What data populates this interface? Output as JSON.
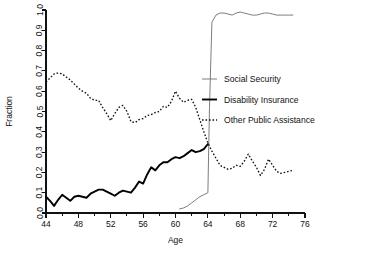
{
  "chart_data": {
    "type": "line",
    "title": "",
    "xlabel": "Age",
    "ylabel": "Fraction",
    "xlim": [
      44,
      76
    ],
    "ylim": [
      0.0,
      1.0
    ],
    "grid": false,
    "legend_position": "center-right",
    "x_ticks_major": [
      44,
      48,
      52,
      56,
      60,
      64,
      68,
      72,
      76
    ],
    "x_ticks_minor": [
      46,
      50,
      54,
      58,
      62,
      66,
      70,
      74
    ],
    "x_tick_labels": [
      "44",
      "48",
      "52",
      "56",
      "60",
      "64",
      "68",
      "72",
      "76"
    ],
    "y_ticks": [
      0.0,
      0.1,
      0.2,
      0.3,
      0.4,
      0.5,
      0.6,
      0.7,
      0.8,
      0.9,
      1.0
    ],
    "y_tick_labels": [
      "0.0",
      "0.1",
      "0.2",
      "0.3",
      "0.4",
      "0.5",
      "0.6",
      "0.7",
      "0.8",
      "0.9",
      "1.0"
    ],
    "series": [
      {
        "name": "Social Security",
        "style": "thin-solid",
        "color": "#7d7d7d",
        "x": [
          60.5,
          61,
          61.5,
          62,
          62.5,
          63,
          63.5,
          64,
          64.2,
          64.5,
          65,
          65.5,
          66,
          66.5,
          67,
          67.5,
          68,
          68.5,
          69,
          69.5,
          70,
          70.5,
          71,
          71.5,
          72,
          72.5,
          73,
          73.5,
          74,
          74.5
        ],
        "values": [
          0.02,
          0.025,
          0.035,
          0.05,
          0.065,
          0.08,
          0.09,
          0.1,
          0.52,
          0.94,
          0.975,
          0.985,
          0.985,
          0.98,
          0.975,
          0.985,
          0.99,
          0.985,
          0.98,
          0.975,
          0.975,
          0.98,
          0.985,
          0.985,
          0.98,
          0.975,
          0.975,
          0.975,
          0.975,
          0.975
        ]
      },
      {
        "name": "Disability Insurance",
        "style": "thick-solid",
        "color": "#000000",
        "x": [
          44,
          44.5,
          45,
          45.5,
          46,
          46.5,
          47,
          47.5,
          48,
          48.5,
          49,
          49.5,
          50,
          50.5,
          51,
          51.5,
          52,
          52.5,
          53,
          53.5,
          54,
          54.5,
          55,
          55.5,
          56,
          56.5,
          57,
          57.5,
          58,
          58.5,
          59,
          59.5,
          60,
          60.5,
          61,
          61.5,
          62,
          62.5,
          63,
          63.5,
          64
        ],
        "values": [
          0.08,
          0.06,
          0.035,
          0.065,
          0.09,
          0.075,
          0.06,
          0.08,
          0.085,
          0.08,
          0.075,
          0.095,
          0.105,
          0.115,
          0.115,
          0.105,
          0.095,
          0.085,
          0.1,
          0.11,
          0.105,
          0.1,
          0.125,
          0.155,
          0.145,
          0.19,
          0.225,
          0.21,
          0.235,
          0.25,
          0.25,
          0.265,
          0.275,
          0.27,
          0.28,
          0.295,
          0.31,
          0.3,
          0.305,
          0.315,
          0.34
        ]
      },
      {
        "name": "Other Public Assistance",
        "style": "dotted",
        "color": "#111111",
        "x": [
          44,
          44.5,
          45,
          45.5,
          46,
          46.5,
          47,
          47.5,
          48,
          48.5,
          49,
          49.5,
          50,
          50.5,
          51,
          51.5,
          52,
          52.5,
          53,
          53.5,
          54,
          54.5,
          55,
          55.5,
          56,
          56.5,
          57,
          57.5,
          58,
          58.5,
          59,
          59.5,
          60,
          60.5,
          61,
          61.5,
          62,
          62.5,
          63,
          63.5,
          64,
          64.5,
          65,
          65.5,
          66,
          66.5,
          67,
          67.5,
          68,
          68.5,
          69,
          69.5,
          70,
          70.5,
          71,
          71.5,
          72,
          72.5,
          73,
          73.5,
          74,
          74.5
        ],
        "values": [
          0.645,
          0.665,
          0.685,
          0.69,
          0.685,
          0.67,
          0.655,
          0.635,
          0.615,
          0.6,
          0.59,
          0.565,
          0.555,
          0.555,
          0.52,
          0.49,
          0.455,
          0.49,
          0.52,
          0.53,
          0.5,
          0.45,
          0.445,
          0.46,
          0.465,
          0.48,
          0.485,
          0.495,
          0.5,
          0.525,
          0.52,
          0.55,
          0.6,
          0.565,
          0.545,
          0.555,
          0.56,
          0.52,
          0.46,
          0.4,
          0.345,
          0.305,
          0.27,
          0.235,
          0.225,
          0.215,
          0.22,
          0.235,
          0.23,
          0.255,
          0.29,
          0.255,
          0.225,
          0.185,
          0.215,
          0.265,
          0.235,
          0.205,
          0.195,
          0.2,
          0.205,
          0.21
        ]
      }
    ]
  },
  "legend": {
    "items": [
      {
        "label": "Social Security"
      },
      {
        "label": "Disability Insurance"
      },
      {
        "label": "Other Public Assistance"
      }
    ]
  }
}
